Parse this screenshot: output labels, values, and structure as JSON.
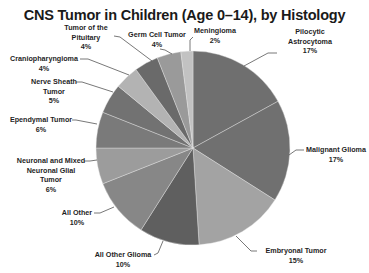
{
  "chart_data": {
    "type": "pie",
    "title": "CNS Tumor in Children (Age 0–14), by Histology",
    "start_angle_deg": 0,
    "direction": "clockwise",
    "slices": [
      {
        "label": "Pilocytic Astrocytoma",
        "value": 17,
        "display": "17%",
        "color": "#6f6f6f"
      },
      {
        "label": "Malignant Glioma",
        "value": 17,
        "display": "17%",
        "color": "#707070"
      },
      {
        "label": "Embryonal Tumor",
        "value": 15,
        "display": "15%",
        "color": "#a3a3a3"
      },
      {
        "label": "All Other Glioma",
        "value": 10,
        "display": "10%",
        "color": "#5f5f5f"
      },
      {
        "label": "All Other",
        "value": 10,
        "display": "10%",
        "color": "#878787"
      },
      {
        "label": "Neuronal and Mixed Neuronal Glial Tumor",
        "value": 6,
        "display": "6%",
        "color": "#9c9c9c"
      },
      {
        "label": "Ependymal Tumor",
        "value": 6,
        "display": "6%",
        "color": "#7a7a7a"
      },
      {
        "label": "Nerve Sheath Tumor",
        "value": 5,
        "display": "5%",
        "color": "#727272"
      },
      {
        "label": "Craniopharyngioma",
        "value": 4,
        "display": "4%",
        "color": "#b3b3b3"
      },
      {
        "label": "Tumor of the Pituitary",
        "value": 4,
        "display": "4%",
        "color": "#6a6a6a"
      },
      {
        "label": "Germ Cell Tumor",
        "value": 4,
        "display": "4%",
        "color": "#9a9a9a"
      },
      {
        "label": "Meningioma",
        "value": 2,
        "display": "2%",
        "color": "#c2c2c2"
      }
    ],
    "legend": "none (data labels with leader lines)"
  },
  "labels": {
    "pilocytic": {
      "line1": "Pilocytic",
      "line2": "Astrocytoma",
      "pct": "17%"
    },
    "malignant": {
      "line1": "Malignant Glioma",
      "pct": "17%"
    },
    "embryonal": {
      "line1": "Embryonal Tumor",
      "pct": "15%"
    },
    "allotherglioma": {
      "line1": "All Other Glioma",
      "pct": "10%"
    },
    "allother": {
      "line1": "All Other",
      "pct": "10%"
    },
    "neuronal": {
      "line1": "Neuronal and Mixed",
      "line2": "Neuronal Glial",
      "line3": "Tumor",
      "pct": "6%"
    },
    "ependymal": {
      "line1": "Ependymal Tumor",
      "pct": "6%"
    },
    "nervesheath": {
      "line1": "Nerve Sheath",
      "line2": "Tumor",
      "pct": "5%"
    },
    "cranio": {
      "line1": "Craniopharyngioma",
      "pct": "4%"
    },
    "pituitary": {
      "line1": "Tumor of the",
      "line2": "Pituitary",
      "pct": "4%"
    },
    "germcell": {
      "line1": "Germ Cell Tumor",
      "pct": "4%"
    },
    "meningioma": {
      "line1": "Meningioma",
      "pct": "2%"
    }
  }
}
